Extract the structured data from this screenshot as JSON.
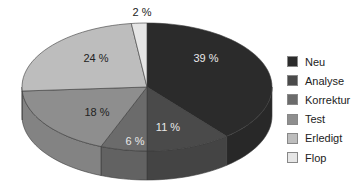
{
  "chart_data": {
    "type": "pie",
    "style": "3d-exploded-none",
    "title": "",
    "categories": [
      "Neu",
      "Analyse",
      "Korrektur",
      "Test",
      "Erledigt",
      "Flop"
    ],
    "values": [
      39,
      11,
      6,
      18,
      24,
      2
    ],
    "labels": [
      "39 %",
      "11 %",
      "6 %",
      "18 %",
      "24 %",
      "2 %"
    ],
    "colors": [
      "#2b2b2b",
      "#4a4a4a",
      "#6b6b6b",
      "#8e8e8e",
      "#bdbdbd",
      "#e6e6e6"
    ],
    "legend_position": "right",
    "start_angle_deg": 90,
    "direction": "clockwise"
  },
  "legend": {
    "items": [
      {
        "label": "Neu",
        "color": "#2b2b2b"
      },
      {
        "label": "Analyse",
        "color": "#4a4a4a"
      },
      {
        "label": "Korrektur",
        "color": "#6b6b6b"
      },
      {
        "label": "Test",
        "color": "#8e8e8e"
      },
      {
        "label": "Erledigt",
        "color": "#bdbdbd"
      },
      {
        "label": "Flop",
        "color": "#e6e6e6"
      }
    ]
  }
}
